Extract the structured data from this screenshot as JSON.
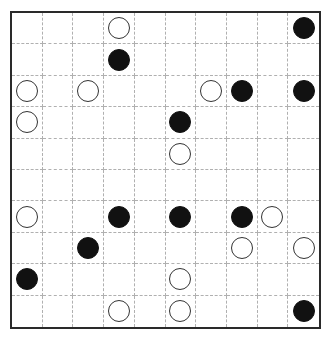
{
  "puzzle": {
    "type": "masyu",
    "rows": 10,
    "cols": 10,
    "colors": {
      "white_pearl": "#ffffff",
      "black_pearl": "#111111",
      "grid_line": "#b0b0b0",
      "border": "#2a2a2a"
    },
    "pearls": [
      {
        "row": 0,
        "col": 3,
        "color": "white"
      },
      {
        "row": 0,
        "col": 9,
        "color": "black"
      },
      {
        "row": 1,
        "col": 3,
        "color": "black"
      },
      {
        "row": 2,
        "col": 0,
        "color": "white"
      },
      {
        "row": 2,
        "col": 2,
        "color": "white"
      },
      {
        "row": 2,
        "col": 6,
        "color": "white"
      },
      {
        "row": 2,
        "col": 7,
        "color": "black"
      },
      {
        "row": 2,
        "col": 9,
        "color": "black"
      },
      {
        "row": 3,
        "col": 0,
        "color": "white"
      },
      {
        "row": 3,
        "col": 5,
        "color": "black"
      },
      {
        "row": 4,
        "col": 5,
        "color": "white"
      },
      {
        "row": 6,
        "col": 0,
        "color": "white"
      },
      {
        "row": 6,
        "col": 3,
        "color": "black"
      },
      {
        "row": 6,
        "col": 5,
        "color": "black"
      },
      {
        "row": 6,
        "col": 7,
        "color": "black"
      },
      {
        "row": 6,
        "col": 8,
        "color": "white"
      },
      {
        "row": 7,
        "col": 2,
        "color": "black"
      },
      {
        "row": 7,
        "col": 7,
        "color": "white"
      },
      {
        "row": 7,
        "col": 9,
        "color": "white"
      },
      {
        "row": 8,
        "col": 0,
        "color": "black"
      },
      {
        "row": 8,
        "col": 5,
        "color": "white"
      },
      {
        "row": 9,
        "col": 3,
        "color": "white"
      },
      {
        "row": 9,
        "col": 5,
        "color": "white"
      },
      {
        "row": 9,
        "col": 9,
        "color": "black"
      }
    ]
  }
}
